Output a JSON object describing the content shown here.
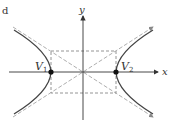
{
  "diagram": {
    "type": "hyperbola",
    "corner_mark": "d",
    "axes": {
      "x_label": "x",
      "y_label": "y"
    },
    "vertices": [
      {
        "label": "V",
        "subscript": "1"
      },
      {
        "label": "V",
        "subscript": "2"
      }
    ],
    "elements": [
      "transverse-axis",
      "central-rectangle",
      "asymptotes",
      "hyperbola-branches"
    ],
    "colors": {
      "curve": "#444444",
      "axes": "#333333",
      "dashed": "#888888"
    }
  }
}
